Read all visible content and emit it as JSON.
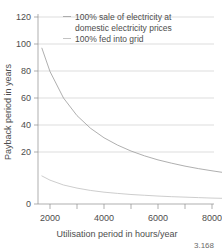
{
  "chart_data": {
    "type": "line",
    "title": "",
    "xlabel": "Utilisation period in hours/year",
    "ylabel": "Payback period in years",
    "xlim": [
      1500,
      8800
    ],
    "ylim": [
      0,
      120
    ],
    "xticks": [
      2000,
      3000,
      4000,
      5000,
      6000,
      7000,
      8000
    ],
    "xtick_labels": [
      "2000",
      "",
      "4000",
      "",
      "6000",
      "",
      "8000"
    ],
    "yticks": [
      0,
      20,
      40,
      60,
      80,
      100,
      120
    ],
    "ytick_labels": [
      "0",
      "20",
      "40",
      "60",
      "80",
      "100",
      "120"
    ],
    "grid": "horizontal",
    "legend_position": "top-right",
    "x": [
      1700,
      2000,
      2500,
      3000,
      3500,
      4000,
      4500,
      5000,
      5500,
      6000,
      6500,
      7000,
      7500,
      8000,
      8500,
      8700
    ],
    "series": [
      {
        "name": "100% sale of electricity at domestic electricity prices",
        "marker": "line",
        "color": "#9a9a9a",
        "values": [
          100.0,
          85.0,
          68.0,
          56.7,
          48.6,
          42.5,
          37.8,
          34.0,
          30.9,
          28.3,
          26.2,
          24.3,
          22.7,
          21.3,
          20.0,
          19.5
        ]
      },
      {
        "name": "100% fed into grid",
        "marker": "line",
        "color": "#c0c0c0",
        "values": [
          18.0,
          15.3,
          12.2,
          10.2,
          8.7,
          7.6,
          6.8,
          6.1,
          5.6,
          5.1,
          4.7,
          4.4,
          4.1,
          3.8,
          3.6,
          3.5
        ]
      }
    ],
    "legend": [
      {
        "label_line1": "100% sale of electricity at",
        "label_line2": "domestic electricity prices",
        "has_marker": true,
        "color": "#9a9a9a"
      },
      {
        "label_line1": "100% fed into grid",
        "label_line2": "",
        "has_marker": true,
        "color": "#c0c0c0"
      }
    ]
  },
  "caption": {
    "figure_number": "3.168"
  }
}
